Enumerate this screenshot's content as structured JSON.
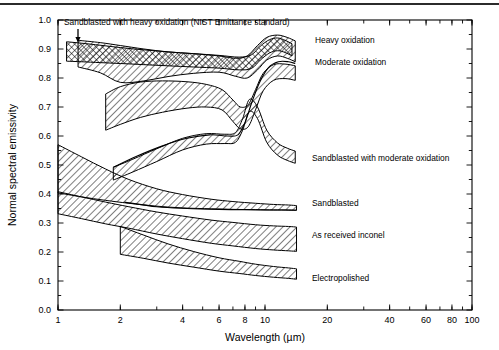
{
  "figure": {
    "background": "#ffffff",
    "ink": "#000000",
    "top_rule": true
  },
  "chart_data": {
    "type": "area",
    "title": "",
    "xlabel": "Wavelength (µm)",
    "ylabel": "Normal spectral emissivity",
    "xscale": "log",
    "yscale": "linear",
    "xlim": [
      1,
      100
    ],
    "ylim": [
      0.0,
      1.0
    ],
    "grid": false,
    "legend": "inline-annotations",
    "xticks": [
      1,
      2,
      4,
      6,
      8,
      10,
      20,
      40,
      60,
      80,
      100
    ],
    "xticklabels": [
      "1",
      "2",
      "4",
      "6",
      "8",
      "10",
      "20",
      "40",
      "60",
      "80",
      "100"
    ],
    "yticks": [
      0.0,
      0.1,
      0.2,
      0.3,
      0.4,
      0.5,
      0.6,
      0.7,
      0.8,
      0.9,
      1.0
    ],
    "yticklabels": [
      "0.0",
      "0.1",
      "0.2",
      "0.3",
      "0.4",
      "0.5",
      "0.6",
      "0.7",
      "0.8",
      "0.9",
      "1.0"
    ],
    "series": [
      {
        "name": "Sandblasted with heavy oxidation (NIST Emittance standard)",
        "fill": "crosshatch",
        "x": [
          1.1,
          1.3,
          1.6,
          2.0,
          2.6,
          3.4,
          4.5,
          6.0,
          7.5,
          8.6,
          9.5,
          10.5,
          11.5,
          12.5,
          13.5
        ],
        "upper": [
          0.925,
          0.92,
          0.913,
          0.905,
          0.897,
          0.89,
          0.884,
          0.878,
          0.872,
          0.88,
          0.91,
          0.932,
          0.938,
          0.93,
          0.918
        ],
        "lower": [
          0.858,
          0.856,
          0.853,
          0.85,
          0.846,
          0.842,
          0.838,
          0.834,
          0.828,
          0.833,
          0.862,
          0.886,
          0.894,
          0.888,
          0.876
        ]
      },
      {
        "name": "Heavy oxidation",
        "fill": "hatch-right",
        "x": [
          1.25,
          1.6,
          2.0,
          2.6,
          3.4,
          4.5,
          6.0,
          7.2,
          8.2,
          9.2,
          10.2,
          11.5,
          12.8,
          14.0
        ],
        "upper": [
          0.93,
          0.922,
          0.912,
          0.9,
          0.89,
          0.884,
          0.876,
          0.868,
          0.876,
          0.912,
          0.94,
          0.948,
          0.94,
          0.928
        ],
        "lower": [
          0.838,
          0.818,
          0.785,
          0.79,
          0.805,
          0.816,
          0.82,
          0.806,
          0.8,
          0.828,
          0.862,
          0.876,
          0.868,
          0.856
        ]
      },
      {
        "name": "Moderate oxidation",
        "fill": "hatch-right",
        "x": [
          1.7,
          2.0,
          2.5,
          3.2,
          4.2,
          5.2,
          6.2,
          7.0,
          7.6,
          8.3,
          9.0,
          9.8,
          11.0,
          12.5,
          14.0
        ],
        "upper": [
          0.745,
          0.77,
          0.786,
          0.79,
          0.787,
          0.778,
          0.76,
          0.724,
          0.7,
          0.708,
          0.76,
          0.816,
          0.846,
          0.848,
          0.842
        ],
        "lower": [
          0.62,
          0.64,
          0.664,
          0.682,
          0.696,
          0.7,
          0.69,
          0.65,
          0.625,
          0.632,
          0.69,
          0.756,
          0.792,
          0.798,
          0.792
        ]
      },
      {
        "name": "Sandblasted with moderate oxidation",
        "fill": "hatch-right",
        "x": [
          1.85,
          2.3,
          3.0,
          4.0,
          5.2,
          6.4,
          7.2,
          7.8,
          8.4,
          9.2,
          10.2,
          11.5,
          12.8,
          14.0
        ],
        "upper": [
          0.492,
          0.52,
          0.556,
          0.592,
          0.608,
          0.606,
          0.612,
          0.66,
          0.726,
          0.7,
          0.62,
          0.576,
          0.558,
          0.548
        ],
        "lower": [
          0.448,
          0.476,
          0.512,
          0.552,
          0.572,
          0.574,
          0.578,
          0.62,
          0.684,
          0.66,
          0.578,
          0.534,
          0.516,
          0.506
        ]
      },
      {
        "name": "Sandblasted",
        "fill": "hatch-right",
        "x": [
          1.0,
          1.3,
          1.7,
          2.2,
          3.0,
          4.0,
          5.5,
          7.0,
          9.0,
          11.0,
          13.0,
          14.2
        ],
        "upper": [
          0.57,
          0.528,
          0.486,
          0.45,
          0.418,
          0.398,
          0.382,
          0.374,
          0.368,
          0.364,
          0.362,
          0.36
        ],
        "lower": [
          0.404,
          0.39,
          0.378,
          0.368,
          0.358,
          0.352,
          0.349,
          0.347,
          0.346,
          0.345,
          0.345,
          0.344
        ]
      },
      {
        "name": "As received inconel",
        "fill": "hatch-right",
        "x": [
          1.0,
          1.3,
          1.7,
          2.2,
          3.0,
          4.0,
          5.5,
          7.0,
          9.0,
          11.0,
          13.0,
          14.2
        ],
        "upper": [
          0.408,
          0.39,
          0.372,
          0.356,
          0.338,
          0.324,
          0.31,
          0.302,
          0.294,
          0.29,
          0.288,
          0.286
        ],
        "lower": [
          0.332,
          0.315,
          0.297,
          0.282,
          0.262,
          0.246,
          0.23,
          0.221,
          0.212,
          0.207,
          0.204,
          0.202
        ]
      },
      {
        "name": "Electropolished",
        "fill": "hatch-right",
        "x": [
          2.0,
          2.6,
          3.4,
          4.5,
          6.0,
          7.5,
          9.0,
          11.0,
          13.0,
          14.2
        ],
        "upper": [
          0.288,
          0.258,
          0.228,
          0.202,
          0.18,
          0.168,
          0.158,
          0.15,
          0.145,
          0.142
        ],
        "lower": [
          0.192,
          0.178,
          0.162,
          0.148,
          0.134,
          0.126,
          0.119,
          0.113,
          0.109,
          0.106
        ]
      }
    ],
    "overlay_curves": [
      {
        "name": "moderate-oxidation-inner-boundary",
        "x": [
          1.85,
          2.4,
          3.2,
          4.2,
          5.4,
          6.6,
          7.4,
          8.0,
          8.6,
          9.4,
          10.4,
          11.6,
          13.0,
          14.0
        ],
        "y": [
          0.492,
          0.53,
          0.566,
          0.592,
          0.604,
          0.6,
          0.604,
          0.646,
          0.712,
          0.784,
          0.836,
          0.856,
          0.856,
          0.85
        ]
      },
      {
        "name": "sandblasted-upper-overlap",
        "x": [
          2.1,
          3.0,
          4.2,
          6.0,
          8.0,
          10.0,
          12.0,
          14.2
        ],
        "y": [
          0.372,
          0.356,
          0.35,
          0.347,
          0.346,
          0.345,
          0.345,
          0.344
        ]
      }
    ],
    "annotations": [
      {
        "text": "Sandblasted with heavy oxidation (NIST Emittance standard)",
        "x_px": 64,
        "y_px": 25,
        "anchor": "start",
        "arrow": true
      },
      {
        "text": "Heavy oxidation",
        "x_px": 315,
        "y_px": 43,
        "anchor": "start",
        "arrow": false
      },
      {
        "text": "Moderate oxidation",
        "x_px": 315,
        "y_px": 65,
        "anchor": "start",
        "arrow": false
      },
      {
        "text": "Sandblasted with moderate oxidation",
        "x_px": 312,
        "y_px": 161,
        "anchor": "start",
        "arrow": false
      },
      {
        "text": "Sandblasted",
        "x_px": 312,
        "y_px": 206,
        "anchor": "start",
        "arrow": false
      },
      {
        "text": "As received inconel",
        "x_px": 312,
        "y_px": 238,
        "anchor": "start",
        "arrow": false
      },
      {
        "text": "Electropolished",
        "x_px": 312,
        "y_px": 281,
        "anchor": "start",
        "arrow": false
      }
    ]
  }
}
